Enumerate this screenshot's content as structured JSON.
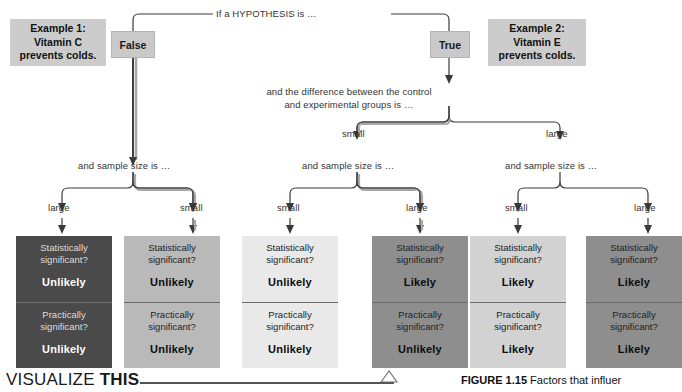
{
  "diagram": {
    "root_label": "If a HYPOTHESIS is …",
    "branches": [
      {
        "id": "false",
        "label": "False"
      },
      {
        "id": "true",
        "label": "True"
      }
    ],
    "examples": [
      {
        "id": "example-1",
        "line1": "Example 1:",
        "line2": "Vitamin C",
        "line3": "prevents colds."
      },
      {
        "id": "example-2",
        "line1": "Example 2:",
        "line2": "Vitamin E",
        "line3": "prevents colds."
      }
    ],
    "difference_prompt_line1": "and the difference between the control",
    "difference_prompt_line2": "and experimental groups is …",
    "difference_options": {
      "small": "small",
      "large": "large"
    },
    "sample_size_prompt": "and sample size is …",
    "sample_size_prompts": [
      "and sample size is …",
      "and sample size is …",
      "and sample size is …"
    ],
    "sample_size_labels": [
      "large",
      "small",
      "small",
      "large",
      "small",
      "large"
    ],
    "question_statistical": {
      "line1": "Statistically",
      "line2": "significant?"
    },
    "question_practical": {
      "line1": "Practically",
      "line2": "significant?"
    },
    "outcomes": [
      {
        "id": "outcome-1",
        "statistical": "Unlikely",
        "practical": "Unlikely",
        "shade_top": "shade-darkest",
        "shade_bottom": "shade-darkest"
      },
      {
        "id": "outcome-2",
        "statistical": "Unlikely",
        "practical": "Unlikely",
        "shade_top": "shade-mid",
        "shade_bottom": "shade-mid"
      },
      {
        "id": "outcome-3",
        "statistical": "Unlikely",
        "practical": "Unlikely",
        "shade_top": "shade-lightest",
        "shade_bottom": "shade-lightest"
      },
      {
        "id": "outcome-4",
        "statistical": "Likely",
        "practical": "Unlikely",
        "shade_top": "shade-dark",
        "shade_bottom": "shade-dark"
      },
      {
        "id": "outcome-5",
        "statistical": "Likely",
        "practical": "Likely",
        "shade_top": "shade-light",
        "shade_bottom": "shade-light"
      },
      {
        "id": "outcome-6",
        "statistical": "Likely",
        "practical": "Likely",
        "shade_top": "shade-dark",
        "shade_bottom": "shade-dark"
      }
    ]
  },
  "footer": {
    "visualize_word1": "VISUALIZE",
    "visualize_word2": "THIS",
    "figure_number": "FIGURE 1.15",
    "figure_caption": "Factors that influer"
  },
  "colors": {
    "node_fill": "#c9c9c9",
    "example_fill": "#cccccc",
    "line": "#3a3a3a",
    "highlight_path": "#9a9a9a"
  }
}
